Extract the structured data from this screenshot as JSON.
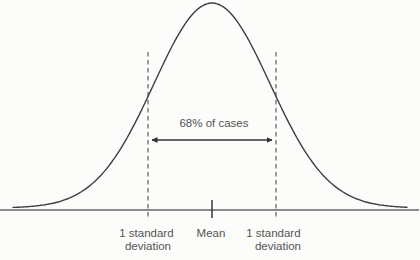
{
  "figure": {
    "annotation": "68% of cases",
    "labels": {
      "left_sd_line1": "1 standard",
      "left_sd_line2": "deviation",
      "mean": "Mean",
      "right_sd_line1": "1 standard",
      "right_sd_line2": "deviation"
    },
    "curve": {
      "mean_x": 212,
      "sigma_px": 58,
      "amplitude_px": 205,
      "baseline_y": 208,
      "x_start": 13,
      "x_end": 408
    },
    "geometry": {
      "axis_y": 210,
      "left_sd_x": 148,
      "right_sd_x": 276,
      "dash_top_y": 52,
      "dash_bottom_y": 218,
      "arrow_y": 140
    },
    "colors": {
      "curve": "#3f3f3f",
      "axis": "#8b8b8b",
      "dashed": "#4f4f4f",
      "text": "#545454",
      "arrow": "#333333",
      "background": "#fcfcfb"
    }
  }
}
